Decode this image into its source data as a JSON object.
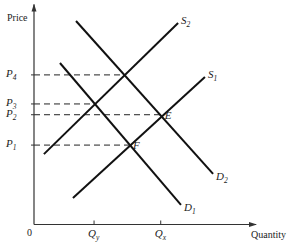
{
  "chart_data": {
    "type": "line",
    "title": "",
    "xlabel": "Quantity",
    "ylabel": "Price",
    "xlim": [
      0,
      10
    ],
    "ylim": [
      0,
      10
    ],
    "origin_label": "0",
    "grid": false,
    "price_levels": [
      {
        "id": "P4",
        "base": "P",
        "sub": "4",
        "value": 6.8,
        "dash_to_x": 4.1
      },
      {
        "id": "P3",
        "base": "P",
        "sub": "3",
        "value": 5.48,
        "dash_to_x": 2.77
      },
      {
        "id": "P2",
        "base": "P",
        "sub": "2",
        "value": 4.99,
        "dash_to_x": 5.76
      },
      {
        "id": "P1",
        "base": "P",
        "sub": "1",
        "value": 3.61,
        "dash_to_x": 4.32
      }
    ],
    "quantity_levels": [
      {
        "id": "Qy",
        "base": "Q",
        "sub": "y",
        "value": 2.73
      },
      {
        "id": "Qx",
        "base": "Q",
        "sub": "x",
        "value": 5.76
      }
    ],
    "series": [
      {
        "name": "S2",
        "base": "S",
        "sub": "2",
        "kind": "supply",
        "points": [
          [
            0.45,
            3.2
          ],
          [
            6.55,
            9.16
          ]
        ],
        "label_pos": "end"
      },
      {
        "name": "S1",
        "base": "S",
        "sub": "1",
        "kind": "supply",
        "points": [
          [
            1.77,
            1.2
          ],
          [
            7.77,
            6.7
          ]
        ],
        "label_pos": "end"
      },
      {
        "name": "D2",
        "base": "D",
        "sub": "2",
        "kind": "demand",
        "points": [
          [
            1.91,
            9.25
          ],
          [
            8.14,
            2.3
          ]
        ],
        "label_pos": "end"
      },
      {
        "name": "D1",
        "base": "D",
        "sub": "1",
        "kind": "demand",
        "points": [
          [
            1.18,
            7.34
          ],
          [
            6.68,
            0.89
          ]
        ],
        "label_pos": "end"
      }
    ],
    "annotations": [
      {
        "text": "E",
        "x": 5.76,
        "y": 4.99
      },
      {
        "text": "F",
        "x": 4.32,
        "y": 3.61
      }
    ]
  }
}
